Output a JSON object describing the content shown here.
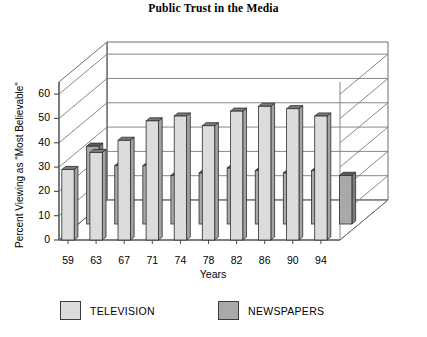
{
  "chart": {
    "title": "Public Trust in the Media"
  },
  "axes": {
    "y_title": "Percent Viewing as \"Most Believable\"",
    "x_title": "Years"
  },
  "legend": {
    "items": [
      {
        "label": "TELEVISION",
        "color": "#dcdcdc"
      },
      {
        "label": "NEWSPAPERS",
        "color": "#a9a9a9"
      }
    ]
  },
  "chart_data": {
    "type": "bar",
    "title": "Public Trust in the Media",
    "xlabel": "Years",
    "ylabel": "Percent Viewing as \"Most Believable\"",
    "ylim": [
      0,
      65
    ],
    "yticks": [
      0,
      10,
      20,
      30,
      40,
      50,
      60
    ],
    "grid": true,
    "legend_position": "bottom",
    "projection": "3d-grouped",
    "categories": [
      "59",
      "63",
      "67",
      "71",
      "74",
      "78",
      "82",
      "86",
      "90",
      "94"
    ],
    "series": [
      {
        "name": "TELEVISION",
        "color": "#dcdcdc",
        "values": [
          29,
          36,
          41,
          49,
          51,
          47,
          53,
          55,
          54,
          51
        ]
      },
      {
        "name": "NEWSPAPERS",
        "color": "#a9a9a9",
        "values": [
          32,
          24,
          24,
          20,
          21,
          23,
          22,
          21,
          22,
          20
        ]
      }
    ]
  }
}
